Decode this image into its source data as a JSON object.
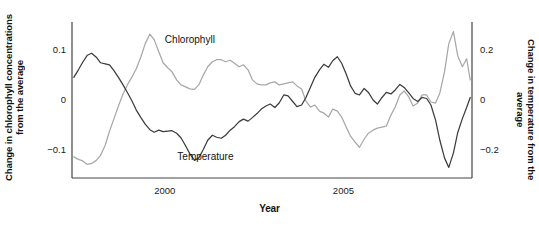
{
  "chart_data": {
    "type": "line",
    "title": "",
    "xlabel": "Year",
    "ylabel": "Change in chlorophyll concentrations from the average",
    "ylabel_right": "Change in temperature from the average",
    "grid": false,
    "legend_position": "inline-annotations",
    "xlim": [
      1997.4,
      2008.6
    ],
    "xticks": [
      2000,
      2005
    ],
    "xtick_labels": [
      "2000",
      "2005"
    ],
    "ylim_left": [
      -0.155,
      0.155
    ],
    "yticks_left": [
      0.1,
      0,
      -0.1
    ],
    "ytick_labels_left": [
      "0.1",
      "0",
      "−0.1"
    ],
    "ylim_right": [
      -0.31,
      0.31
    ],
    "yticks_right": [
      0.2,
      0,
      -0.2
    ],
    "ytick_labels_right": [
      "0.2",
      "0",
      "−0.2"
    ],
    "series": [
      {
        "name": "Chlorophyll",
        "axis": "left",
        "color": "#a8a8a8",
        "label_x": 2000.0,
        "label_y": 0.118,
        "x": [
          1997.45,
          1997.58,
          1997.7,
          1997.83,
          1997.95,
          1998.08,
          1998.2,
          1998.33,
          1998.45,
          1998.58,
          1998.7,
          1998.83,
          1998.95,
          1999.08,
          1999.2,
          1999.33,
          1999.45,
          1999.58,
          1999.7,
          1999.83,
          1999.95,
          2000.08,
          2000.2,
          2000.33,
          2000.45,
          2000.58,
          2000.7,
          2000.83,
          2000.95,
          2001.08,
          2001.2,
          2001.33,
          2001.45,
          2001.58,
          2001.7,
          2001.83,
          2001.95,
          2002.08,
          2002.2,
          2002.33,
          2002.45,
          2002.58,
          2002.7,
          2002.83,
          2002.95,
          2003.08,
          2003.2,
          2003.33,
          2003.45,
          2003.58,
          2003.7,
          2003.83,
          2003.95,
          2004.08,
          2004.2,
          2004.33,
          2004.45,
          2004.58,
          2004.7,
          2004.83,
          2004.95,
          2005.08,
          2005.2,
          2005.33,
          2005.45,
          2005.58,
          2005.7,
          2005.83,
          2005.95,
          2006.08,
          2006.2,
          2006.33,
          2006.45,
          2006.58,
          2006.7,
          2006.83,
          2006.95,
          2007.08,
          2007.2,
          2007.33,
          2007.45,
          2007.58,
          2007.7,
          2007.83,
          2007.95,
          2008.08,
          2008.2,
          2008.33,
          2008.45,
          2008.55
        ],
        "y": [
          -0.113,
          -0.118,
          -0.121,
          -0.128,
          -0.126,
          -0.12,
          -0.11,
          -0.09,
          -0.062,
          -0.036,
          -0.012,
          0.012,
          0.03,
          0.046,
          0.062,
          0.086,
          0.112,
          0.131,
          0.12,
          0.096,
          0.074,
          0.064,
          0.056,
          0.04,
          0.03,
          0.026,
          0.022,
          0.021,
          0.03,
          0.05,
          0.066,
          0.076,
          0.08,
          0.08,
          0.076,
          0.079,
          0.073,
          0.066,
          0.07,
          0.06,
          0.04,
          0.032,
          0.03,
          0.03,
          0.034,
          0.036,
          0.03,
          0.032,
          0.034,
          0.036,
          0.028,
          0.022,
          -0.002,
          -0.014,
          -0.01,
          -0.022,
          -0.026,
          -0.034,
          -0.018,
          -0.022,
          -0.034,
          -0.054,
          -0.072,
          -0.084,
          -0.094,
          -0.078,
          -0.066,
          -0.06,
          -0.056,
          -0.054,
          -0.052,
          -0.03,
          -0.014,
          0.01,
          0.018,
          0.006,
          -0.012,
          -0.006,
          0.01,
          0.01,
          -0.004,
          -0.006,
          0.014,
          0.056,
          0.112,
          0.136,
          0.088,
          0.066,
          0.082,
          0.04
        ]
      },
      {
        "name": "Temperature",
        "axis": "right",
        "color": "#3c3c3c",
        "label_x": 2000.35,
        "label_y": -0.23,
        "x": [
          1997.45,
          1997.58,
          1997.7,
          1997.83,
          1997.95,
          1998.08,
          1998.2,
          1998.33,
          1998.45,
          1998.58,
          1998.7,
          1998.83,
          1998.95,
          1999.08,
          1999.2,
          1999.33,
          1999.45,
          1999.58,
          1999.7,
          1999.83,
          1999.95,
          2000.08,
          2000.2,
          2000.33,
          2000.45,
          2000.58,
          2000.7,
          2000.83,
          2000.95,
          2001.08,
          2001.2,
          2001.33,
          2001.45,
          2001.58,
          2001.7,
          2001.83,
          2001.95,
          2002.08,
          2002.2,
          2002.33,
          2002.45,
          2002.58,
          2002.7,
          2002.83,
          2002.95,
          2003.08,
          2003.2,
          2003.33,
          2003.45,
          2003.58,
          2003.7,
          2003.83,
          2003.95,
          2004.08,
          2004.2,
          2004.33,
          2004.45,
          2004.58,
          2004.7,
          2004.83,
          2004.95,
          2005.08,
          2005.2,
          2005.33,
          2005.45,
          2005.58,
          2005.7,
          2005.83,
          2005.95,
          2006.08,
          2006.2,
          2006.33,
          2006.45,
          2006.58,
          2006.7,
          2006.83,
          2006.95,
          2007.08,
          2007.2,
          2007.33,
          2007.45,
          2007.58,
          2007.7,
          2007.83,
          2007.95,
          2008.08,
          2008.2,
          2008.33,
          2008.45,
          2008.55
        ],
        "y": [
          0.09,
          0.12,
          0.15,
          0.178,
          0.186,
          0.17,
          0.148,
          0.144,
          0.14,
          0.116,
          0.09,
          0.06,
          0.03,
          -0.004,
          -0.04,
          -0.07,
          -0.096,
          -0.118,
          -0.128,
          -0.12,
          -0.126,
          -0.124,
          -0.122,
          -0.132,
          -0.15,
          -0.182,
          -0.214,
          -0.24,
          -0.23,
          -0.196,
          -0.16,
          -0.14,
          -0.148,
          -0.152,
          -0.14,
          -0.12,
          -0.106,
          -0.086,
          -0.076,
          -0.084,
          -0.07,
          -0.054,
          -0.036,
          -0.024,
          -0.016,
          -0.03,
          -0.012,
          0.02,
          0.016,
          -0.006,
          -0.026,
          -0.02,
          0.01,
          0.052,
          0.09,
          0.12,
          0.142,
          0.13,
          0.156,
          0.172,
          0.146,
          0.102,
          0.056,
          0.026,
          0.02,
          0.046,
          0.03,
          0.0,
          -0.016,
          0.01,
          0.03,
          0.024,
          0.04,
          0.062,
          0.05,
          0.028,
          0.006,
          -0.006,
          0.01,
          0.006,
          -0.02,
          -0.08,
          -0.16,
          -0.23,
          -0.268,
          -0.21,
          -0.13,
          -0.074,
          -0.03,
          0.01
        ]
      }
    ]
  },
  "axes": {
    "left_title": "Change in chlorophyll concentrations from the average",
    "right_title": "Change in temperature from the average",
    "x_title": "Year"
  },
  "colors": {
    "chlorophyll": "#a8a8a8",
    "temperature": "#3c3c3c",
    "axis": "#444444",
    "text": "#111111"
  }
}
